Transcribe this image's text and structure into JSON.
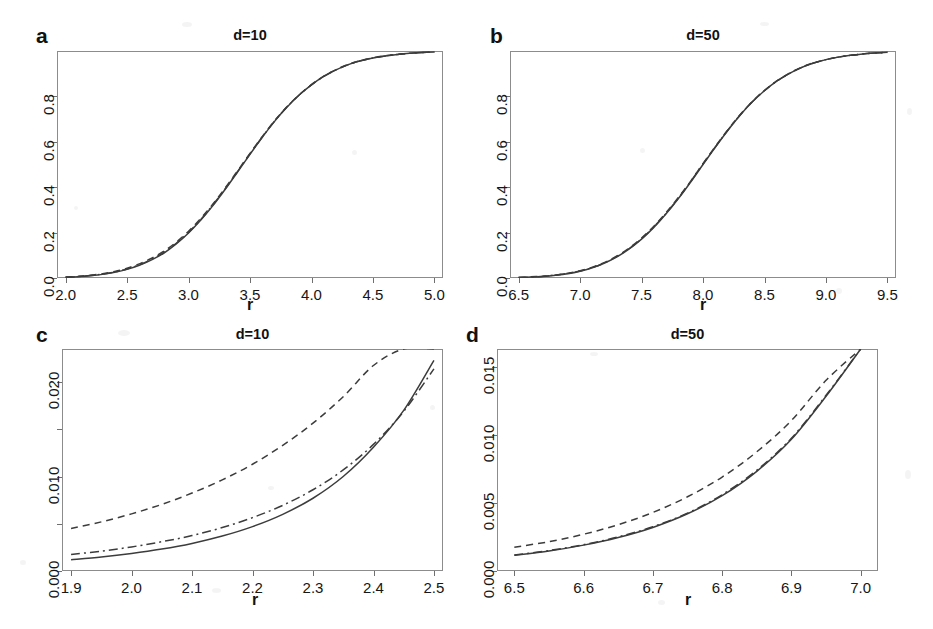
{
  "figure": {
    "background": "#ffffff",
    "line_color": "#3c3c3c",
    "axis_color": "#6f6f6f",
    "panel_count": 4
  },
  "panels": [
    {
      "label": "a",
      "title": "d=10",
      "xlabel": "r",
      "ylabel": "",
      "xticks": [
        "2.0",
        "2.5",
        "3.0",
        "3.5",
        "4.0",
        "4.5",
        "5.0"
      ],
      "yticks": [
        "0.0",
        "0.2",
        "0.4",
        "0.6",
        "0.8"
      ]
    },
    {
      "label": "b",
      "title": "d=50",
      "xlabel": "r",
      "ylabel": "",
      "xticks": [
        "6.5",
        "7.0",
        "7.5",
        "8.0",
        "8.5",
        "9.0",
        "9.5"
      ],
      "yticks": [
        "0.0",
        "0.2",
        "0.4",
        "0.6",
        "0.8"
      ]
    },
    {
      "label": "c",
      "title": "d=10",
      "xlabel": "r",
      "ylabel": "",
      "xticks": [
        "1.9",
        "2.0",
        "2.1",
        "2.2",
        "2.3",
        "2.4",
        "2.5"
      ],
      "yticks": [
        "0.000",
        "0.010",
        "0.020"
      ]
    },
    {
      "label": "d",
      "title": "d=50",
      "xlabel": "r",
      "ylabel": "",
      "xticks": [
        "6.5",
        "6.6",
        "6.7",
        "6.8",
        "6.9",
        "7.0"
      ],
      "yticks": [
        "0.000",
        "0.005",
        "0.010",
        "0.015"
      ]
    }
  ],
  "chart_data": [
    {
      "panel": "a",
      "type": "line",
      "title": "d=10",
      "xlabel": "r",
      "ylabel": "",
      "xlim": [
        1.93,
        5.07
      ],
      "ylim": [
        0.0,
        1.0
      ],
      "xticks": [
        2.0,
        2.5,
        3.0,
        3.5,
        4.0,
        4.5,
        5.0
      ],
      "yticks": [
        0.0,
        0.2,
        0.4,
        0.6,
        0.8
      ],
      "grid": false,
      "legend": "none",
      "x": [
        2.0,
        2.1,
        2.2,
        2.3,
        2.4,
        2.5,
        2.6,
        2.7,
        2.8,
        2.9,
        3.0,
        3.1,
        3.2,
        3.3,
        3.4,
        3.5,
        3.6,
        3.7,
        3.8,
        3.9,
        4.0,
        4.1,
        4.2,
        4.3,
        4.4,
        4.5,
        4.6,
        4.7,
        4.8,
        4.9,
        5.0
      ],
      "series": [
        {
          "name": "empirical (solid)",
          "style": "solid",
          "values": [
            0.003,
            0.006,
            0.01,
            0.016,
            0.025,
            0.038,
            0.056,
            0.08,
            0.11,
            0.15,
            0.198,
            0.255,
            0.32,
            0.392,
            0.468,
            0.545,
            0.62,
            0.69,
            0.752,
            0.806,
            0.851,
            0.888,
            0.917,
            0.94,
            0.957,
            0.969,
            0.978,
            0.985,
            0.99,
            0.993,
            0.996
          ]
        },
        {
          "name": "approximation 1 (dashed)",
          "style": "dashed",
          "values": [
            0.004,
            0.007,
            0.012,
            0.019,
            0.029,
            0.043,
            0.062,
            0.087,
            0.118,
            0.158,
            0.206,
            0.263,
            0.327,
            0.398,
            0.473,
            0.549,
            0.623,
            0.693,
            0.754,
            0.807,
            0.852,
            0.889,
            0.918,
            0.941,
            0.958,
            0.97,
            0.979,
            0.985,
            0.99,
            0.993,
            0.996
          ]
        },
        {
          "name": "approximation 2 (dash-dot)",
          "style": "dashdot",
          "values": [
            0.003,
            0.006,
            0.011,
            0.017,
            0.026,
            0.04,
            0.058,
            0.083,
            0.113,
            0.153,
            0.201,
            0.258,
            0.323,
            0.394,
            0.47,
            0.547,
            0.621,
            0.691,
            0.753,
            0.806,
            0.851,
            0.888,
            0.917,
            0.94,
            0.957,
            0.969,
            0.978,
            0.985,
            0.99,
            0.993,
            0.996
          ]
        }
      ]
    },
    {
      "panel": "b",
      "type": "line",
      "title": "d=50",
      "xlabel": "r",
      "ylabel": "",
      "xlim": [
        6.43,
        9.57
      ],
      "ylim": [
        0.0,
        1.0
      ],
      "xticks": [
        6.5,
        7.0,
        7.5,
        8.0,
        8.5,
        9.0,
        9.5
      ],
      "yticks": [
        0.0,
        0.2,
        0.4,
        0.6,
        0.8
      ],
      "grid": false,
      "legend": "none",
      "x": [
        6.5,
        6.6,
        6.7,
        6.8,
        6.9,
        7.0,
        7.1,
        7.2,
        7.3,
        7.4,
        7.5,
        7.6,
        7.7,
        7.8,
        7.9,
        8.0,
        8.1,
        8.2,
        8.3,
        8.4,
        8.5,
        8.6,
        8.7,
        8.8,
        8.9,
        9.0,
        9.1,
        9.2,
        9.3,
        9.4,
        9.5
      ],
      "series": [
        {
          "name": "empirical (solid)",
          "style": "solid",
          "values": [
            0.002,
            0.004,
            0.007,
            0.012,
            0.019,
            0.03,
            0.045,
            0.066,
            0.093,
            0.128,
            0.171,
            0.223,
            0.283,
            0.35,
            0.423,
            0.5,
            0.576,
            0.649,
            0.716,
            0.775,
            0.825,
            0.867,
            0.9,
            0.927,
            0.947,
            0.962,
            0.973,
            0.981,
            0.987,
            0.991,
            0.994
          ]
        },
        {
          "name": "approximation 1 (dashed)",
          "style": "dashed",
          "values": [
            0.002,
            0.005,
            0.008,
            0.013,
            0.021,
            0.032,
            0.048,
            0.069,
            0.097,
            0.132,
            0.176,
            0.228,
            0.288,
            0.355,
            0.427,
            0.504,
            0.579,
            0.651,
            0.718,
            0.777,
            0.826,
            0.868,
            0.901,
            0.928,
            0.948,
            0.962,
            0.973,
            0.981,
            0.987,
            0.991,
            0.994
          ]
        },
        {
          "name": "approximation 2 (dash-dot)",
          "style": "dashdot",
          "values": [
            0.002,
            0.004,
            0.008,
            0.013,
            0.02,
            0.031,
            0.046,
            0.067,
            0.095,
            0.13,
            0.173,
            0.225,
            0.285,
            0.352,
            0.425,
            0.502,
            0.577,
            0.65,
            0.717,
            0.776,
            0.826,
            0.867,
            0.9,
            0.927,
            0.947,
            0.962,
            0.973,
            0.981,
            0.987,
            0.991,
            0.994
          ]
        }
      ]
    },
    {
      "panel": "c",
      "type": "line",
      "title": "d=10",
      "xlabel": "r",
      "ylabel": "",
      "xlim": [
        1.885,
        2.515
      ],
      "ylim": [
        0.0,
        0.0235
      ],
      "xticks": [
        1.9,
        2.0,
        2.1,
        2.2,
        2.3,
        2.4,
        2.5
      ],
      "yticks": [
        0.0,
        0.01,
        0.02
      ],
      "minor_yticks": [
        0.005,
        0.015
      ],
      "grid": false,
      "legend": "none",
      "x": [
        1.9,
        1.95,
        2.0,
        2.05,
        2.1,
        2.15,
        2.2,
        2.25,
        2.3,
        2.35,
        2.4,
        2.45,
        2.5
      ],
      "series": [
        {
          "name": "upper bound (dashed)",
          "style": "dashed",
          "values": [
            0.0045,
            0.0052,
            0.00605,
            0.00705,
            0.00825,
            0.00965,
            0.0113,
            0.0133,
            0.01565,
            0.01845,
            0.02175,
            0.0256,
            0.03
          ]
        },
        {
          "name": "approximation (dash-dot)",
          "style": "dashdot",
          "values": [
            0.00175,
            0.0021,
            0.00255,
            0.0031,
            0.00375,
            0.0046,
            0.00565,
            0.00695,
            0.0086,
            0.0107,
            0.0134,
            0.0169,
            0.0214
          ]
        },
        {
          "name": "exact (solid)",
          "style": "solid",
          "values": [
            0.0012,
            0.00148,
            0.00185,
            0.00232,
            0.00292,
            0.0037,
            0.0047,
            0.006,
            0.0077,
            0.01,
            0.0131,
            0.017,
            0.0223
          ]
        }
      ]
    },
    {
      "panel": "d",
      "type": "line",
      "title": "d=50",
      "xlabel": "r",
      "ylabel": "",
      "xlim": [
        6.475,
        7.025
      ],
      "ylim": [
        0.0,
        0.0163
      ],
      "xticks": [
        6.5,
        6.6,
        6.7,
        6.8,
        6.9,
        7.0
      ],
      "yticks": [
        0.0,
        0.005,
        0.01,
        0.015
      ],
      "grid": false,
      "legend": "none",
      "x": [
        6.5,
        6.55,
        6.6,
        6.65,
        6.7,
        6.75,
        6.8,
        6.85,
        6.9,
        6.95,
        7.0
      ],
      "series": [
        {
          "name": "upper bound (dashed)",
          "style": "dashed",
          "values": [
            0.00175,
            0.00215,
            0.0027,
            0.0034,
            0.0043,
            0.00545,
            0.0069,
            0.00875,
            0.01105,
            0.014,
            0.01765
          ]
        },
        {
          "name": "approximation (dash-dot)",
          "style": "dashdot",
          "values": [
            0.00118,
            0.0015,
            0.00193,
            0.0025,
            0.00325,
            0.00425,
            0.0056,
            0.0074,
            0.00975,
            0.0129,
            0.017
          ]
        },
        {
          "name": "exact (solid)",
          "style": "solid",
          "values": [
            0.00115,
            0.00147,
            0.0019,
            0.00246,
            0.0032,
            0.0042,
            0.00553,
            0.00732,
            0.00967,
            0.01283,
            0.01705
          ]
        }
      ]
    }
  ]
}
